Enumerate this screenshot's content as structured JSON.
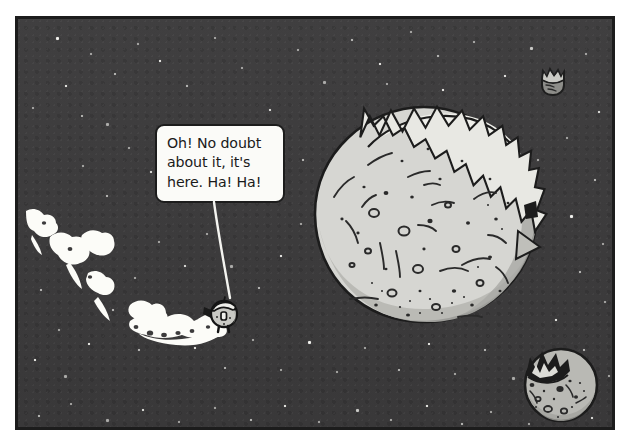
{
  "scene": {
    "title": "Comic panel: spaceman approaching a cracked planet",
    "medium": "ink-and-wash comic panel",
    "panel_frame_color": "#1c1c1c",
    "sky_color": "#3c3b3c",
    "star_color": "#f2f2ee"
  },
  "speech_bubble": {
    "text": "Oh! No doubt\nabout it, it's\nhere. Ha! Ha!",
    "line_1": "Oh! No doubt",
    "line_2": "about it, it's",
    "line_3": "here. Ha! Ha!",
    "fill_color": "#fbfbf8",
    "outline_color": "#1c1c1c",
    "tail_type": "thin-line-pointer",
    "speaker": "rocket-character"
  },
  "objects": {
    "big_planet": {
      "name": "cracked planet",
      "surface_color": "#d6d6d2",
      "shadow_color": "#a9a9a5",
      "rim_highlight_color": "#f0f0ec",
      "outline_color": "#1c1c1c",
      "feature": "zigzag jagged band across upper-right limb",
      "craters": 38
    },
    "small_moon": {
      "name": "small moon",
      "surface_color": "#b9b9b4",
      "outline_color": "#1c1c1c",
      "feature": "dark jagged crown on upper-left"
    },
    "distant_object": {
      "name": "distant fragment",
      "surface_color": "#8d8d89",
      "outline_color": "#202020",
      "feature": "jagged top edge"
    },
    "rocket_character": {
      "name": "spaceman in round pod",
      "body_color": "#c9c9c4",
      "visor_color": "#efefeb",
      "outline_color": "#151515"
    },
    "vapour_trail": {
      "name": "puffy vapour trail",
      "color": "#fcfcf8",
      "puff_clusters": 5,
      "direction": "upper-left to lower-right arc"
    }
  },
  "stars": [
    [
      38,
      18
    ],
    [
      72,
      34
    ],
    [
      119,
      24
    ],
    [
      96,
      54
    ],
    [
      47,
      66
    ],
    [
      14,
      88
    ],
    [
      63,
      96
    ],
    [
      88,
      104
    ],
    [
      141,
      41
    ],
    [
      168,
      66
    ],
    [
      196,
      18
    ],
    [
      223,
      48
    ],
    [
      251,
      90
    ],
    [
      279,
      30
    ],
    [
      305,
      62
    ],
    [
      333,
      20
    ],
    [
      361,
      44
    ],
    [
      392,
      12
    ],
    [
      419,
      36
    ],
    [
      455,
      22
    ],
    [
      486,
      56
    ],
    [
      512,
      28
    ],
    [
      541,
      66
    ],
    [
      567,
      34
    ],
    [
      580,
      92
    ],
    [
      548,
      118
    ],
    [
      519,
      140
    ],
    [
      576,
      160
    ],
    [
      552,
      196
    ],
    [
      584,
      224
    ],
    [
      561,
      252
    ],
    [
      586,
      282
    ],
    [
      537,
      300
    ],
    [
      565,
      330
    ],
    [
      590,
      356
    ],
    [
      541,
      382
    ],
    [
      573,
      398
    ],
    [
      510,
      404
    ],
    [
      472,
      392
    ],
    [
      443,
      404
    ],
    [
      408,
      386
    ],
    [
      372,
      400
    ],
    [
      338,
      390
    ],
    [
      300,
      402
    ],
    [
      266,
      386
    ],
    [
      232,
      400
    ],
    [
      196,
      388
    ],
    [
      160,
      402
    ],
    [
      124,
      390
    ],
    [
      88,
      400
    ],
    [
      52,
      384
    ],
    [
      20,
      396
    ],
    [
      16,
      340
    ],
    [
      40,
      310
    ],
    [
      22,
      270
    ],
    [
      56,
      242
    ],
    [
      30,
      206
    ],
    [
      88,
      176
    ],
    [
      64,
      146
    ],
    [
      110,
      128
    ],
    [
      132,
      152
    ],
    [
      156,
      176
    ],
    [
      180,
      144
    ],
    [
      204,
      176
    ],
    [
      236,
      140
    ],
    [
      258,
      168
    ],
    [
      284,
      140
    ],
    [
      282,
      204
    ],
    [
      262,
      236
    ],
    [
      240,
      268
    ],
    [
      212,
      246
    ],
    [
      188,
      214
    ],
    [
      166,
      246
    ],
    [
      140,
      222
    ],
    [
      116,
      258
    ],
    [
      94,
      290
    ],
    [
      70,
      324
    ],
    [
      46,
      356
    ],
    [
      120,
      330
    ],
    [
      152,
      300
    ],
    [
      176,
      328
    ],
    [
      206,
      348
    ],
    [
      234,
      320
    ],
    [
      262,
      350
    ],
    [
      290,
      322
    ],
    [
      318,
      352
    ],
    [
      346,
      328
    ],
    [
      380,
      350
    ],
    [
      410,
      324
    ],
    [
      436,
      354
    ],
    [
      466,
      330
    ],
    [
      494,
      358
    ],
    [
      424,
      70
    ],
    [
      398,
      92
    ],
    [
      368,
      64
    ]
  ]
}
